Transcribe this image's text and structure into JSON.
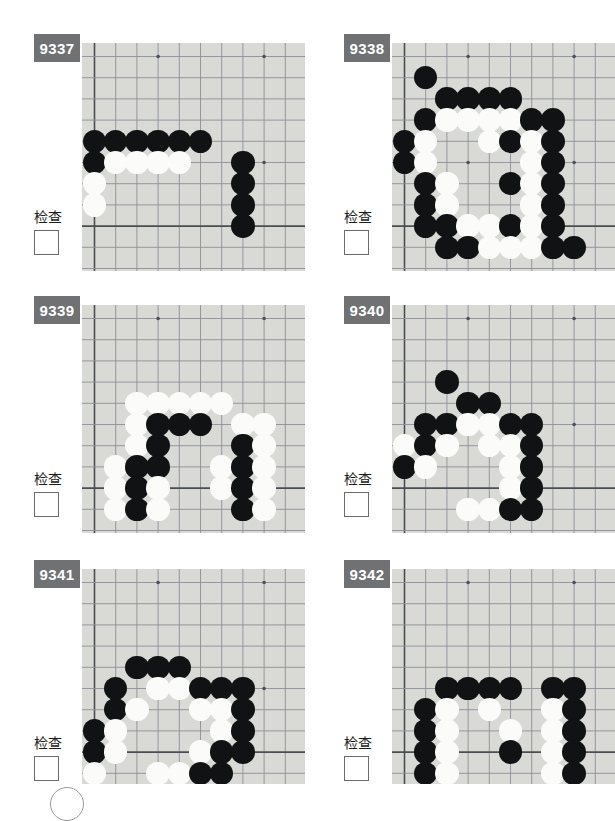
{
  "page": {
    "check_label": "检查",
    "board_color": "#d9dad5",
    "id_box_color": "#6f7173",
    "black_color": "#111214",
    "white_color": "#fbfbf9",
    "grid_cols": 10,
    "grid_rows": 10
  },
  "problems": [
    {
      "id": "9337",
      "check_label": "检查",
      "checked": false,
      "star_points": [
        [
          4,
          1
        ],
        [
          9,
          1
        ],
        [
          4,
          6
        ],
        [
          9,
          6
        ]
      ],
      "edges": {
        "left": 1,
        "bottom": 9
      },
      "stones": [
        {
          "c": 1,
          "r": 5,
          "color": "black"
        },
        {
          "c": 2,
          "r": 5,
          "color": "black"
        },
        {
          "c": 3,
          "r": 5,
          "color": "black"
        },
        {
          "c": 4,
          "r": 5,
          "color": "black"
        },
        {
          "c": 5,
          "r": 5,
          "color": "black"
        },
        {
          "c": 6,
          "r": 5,
          "color": "black"
        },
        {
          "c": 1,
          "r": 6,
          "color": "black"
        },
        {
          "c": 2,
          "r": 6,
          "color": "white"
        },
        {
          "c": 3,
          "r": 6,
          "color": "white"
        },
        {
          "c": 4,
          "r": 6,
          "color": "white"
        },
        {
          "c": 5,
          "r": 6,
          "color": "white"
        },
        {
          "c": 8,
          "r": 6,
          "color": "black"
        },
        {
          "c": 1,
          "r": 7,
          "color": "white"
        },
        {
          "c": 8,
          "r": 7,
          "color": "black"
        },
        {
          "c": 1,
          "r": 8,
          "color": "white"
        },
        {
          "c": 8,
          "r": 8,
          "color": "black"
        },
        {
          "c": 8,
          "r": 9,
          "color": "black"
        }
      ]
    },
    {
      "id": "9338",
      "check_label": "检查",
      "checked": false,
      "star_points": [
        [
          4,
          1
        ],
        [
          9,
          1
        ],
        [
          4,
          6
        ],
        [
          9,
          6
        ]
      ],
      "edges": {
        "left": 1,
        "bottom": 9
      },
      "stones": [
        {
          "c": 2,
          "r": 2,
          "color": "black"
        },
        {
          "c": 3,
          "r": 3,
          "color": "black"
        },
        {
          "c": 4,
          "r": 3,
          "color": "black"
        },
        {
          "c": 5,
          "r": 3,
          "color": "black"
        },
        {
          "c": 6,
          "r": 3,
          "color": "black"
        },
        {
          "c": 2,
          "r": 4,
          "color": "black"
        },
        {
          "c": 3,
          "r": 4,
          "color": "white"
        },
        {
          "c": 4,
          "r": 4,
          "color": "white"
        },
        {
          "c": 5,
          "r": 4,
          "color": "white"
        },
        {
          "c": 6,
          "r": 4,
          "color": "white"
        },
        {
          "c": 7,
          "r": 4,
          "color": "black"
        },
        {
          "c": 8,
          "r": 4,
          "color": "black"
        },
        {
          "c": 1,
          "r": 5,
          "color": "black"
        },
        {
          "c": 2,
          "r": 5,
          "color": "white"
        },
        {
          "c": 5,
          "r": 5,
          "color": "white"
        },
        {
          "c": 6,
          "r": 5,
          "color": "black"
        },
        {
          "c": 7,
          "r": 5,
          "color": "white"
        },
        {
          "c": 8,
          "r": 5,
          "color": "black"
        },
        {
          "c": 1,
          "r": 6,
          "color": "black"
        },
        {
          "c": 2,
          "r": 6,
          "color": "white"
        },
        {
          "c": 7,
          "r": 6,
          "color": "white"
        },
        {
          "c": 8,
          "r": 6,
          "color": "black"
        },
        {
          "c": 2,
          "r": 7,
          "color": "black"
        },
        {
          "c": 3,
          "r": 7,
          "color": "white"
        },
        {
          "c": 6,
          "r": 7,
          "color": "black"
        },
        {
          "c": 7,
          "r": 7,
          "color": "white"
        },
        {
          "c": 8,
          "r": 7,
          "color": "black"
        },
        {
          "c": 2,
          "r": 8,
          "color": "black"
        },
        {
          "c": 3,
          "r": 8,
          "color": "white"
        },
        {
          "c": 7,
          "r": 8,
          "color": "white"
        },
        {
          "c": 8,
          "r": 8,
          "color": "black"
        },
        {
          "c": 2,
          "r": 9,
          "color": "black"
        },
        {
          "c": 3,
          "r": 9,
          "color": "black"
        },
        {
          "c": 4,
          "r": 9,
          "color": "white"
        },
        {
          "c": 5,
          "r": 9,
          "color": "white"
        },
        {
          "c": 6,
          "r": 9,
          "color": "black"
        },
        {
          "c": 7,
          "r": 9,
          "color": "white"
        },
        {
          "c": 8,
          "r": 9,
          "color": "black"
        },
        {
          "c": 3,
          "r": 10,
          "color": "black"
        },
        {
          "c": 4,
          "r": 10,
          "color": "black"
        },
        {
          "c": 5,
          "r": 10,
          "color": "white"
        },
        {
          "c": 6,
          "r": 10,
          "color": "white"
        },
        {
          "c": 7,
          "r": 10,
          "color": "white"
        },
        {
          "c": 8,
          "r": 10,
          "color": "black"
        },
        {
          "c": 9,
          "r": 10,
          "color": "black"
        }
      ]
    },
    {
      "id": "9339",
      "check_label": "检查",
      "checked": false,
      "star_points": [
        [
          4,
          1
        ],
        [
          9,
          1
        ],
        [
          4,
          6
        ],
        [
          9,
          6
        ]
      ],
      "edges": {
        "left": 1,
        "bottom": 9
      },
      "stones": [
        {
          "c": 3,
          "r": 5,
          "color": "white"
        },
        {
          "c": 4,
          "r": 5,
          "color": "white"
        },
        {
          "c": 5,
          "r": 5,
          "color": "white"
        },
        {
          "c": 6,
          "r": 5,
          "color": "white"
        },
        {
          "c": 7,
          "r": 5,
          "color": "white"
        },
        {
          "c": 3,
          "r": 6,
          "color": "white"
        },
        {
          "c": 4,
          "r": 6,
          "color": "black"
        },
        {
          "c": 5,
          "r": 6,
          "color": "black"
        },
        {
          "c": 6,
          "r": 6,
          "color": "black"
        },
        {
          "c": 8,
          "r": 6,
          "color": "white"
        },
        {
          "c": 9,
          "r": 6,
          "color": "white"
        },
        {
          "c": 3,
          "r": 7,
          "color": "white"
        },
        {
          "c": 4,
          "r": 7,
          "color": "black"
        },
        {
          "c": 8,
          "r": 7,
          "color": "black"
        },
        {
          "c": 9,
          "r": 7,
          "color": "white"
        },
        {
          "c": 2,
          "r": 8,
          "color": "white"
        },
        {
          "c": 3,
          "r": 8,
          "color": "black"
        },
        {
          "c": 4,
          "r": 8,
          "color": "black"
        },
        {
          "c": 7,
          "r": 8,
          "color": "white"
        },
        {
          "c": 8,
          "r": 8,
          "color": "black"
        },
        {
          "c": 9,
          "r": 8,
          "color": "white"
        },
        {
          "c": 2,
          "r": 9,
          "color": "white"
        },
        {
          "c": 3,
          "r": 9,
          "color": "black"
        },
        {
          "c": 4,
          "r": 9,
          "color": "white"
        },
        {
          "c": 7,
          "r": 9,
          "color": "white"
        },
        {
          "c": 8,
          "r": 9,
          "color": "black"
        },
        {
          "c": 9,
          "r": 9,
          "color": "white"
        },
        {
          "c": 2,
          "r": 10,
          "color": "white"
        },
        {
          "c": 3,
          "r": 10,
          "color": "black"
        },
        {
          "c": 4,
          "r": 10,
          "color": "white"
        },
        {
          "c": 8,
          "r": 10,
          "color": "black"
        },
        {
          "c": 9,
          "r": 10,
          "color": "white"
        }
      ]
    },
    {
      "id": "9340",
      "check_label": "检查",
      "checked": false,
      "star_points": [
        [
          4,
          1
        ],
        [
          9,
          1
        ],
        [
          4,
          6
        ],
        [
          9,
          6
        ]
      ],
      "edges": {
        "left": 1,
        "bottom": 9
      },
      "stones": [
        {
          "c": 3,
          "r": 4,
          "color": "black"
        },
        {
          "c": 4,
          "r": 5,
          "color": "black"
        },
        {
          "c": 5,
          "r": 5,
          "color": "black"
        },
        {
          "c": 2,
          "r": 6,
          "color": "black"
        },
        {
          "c": 3,
          "r": 6,
          "color": "black"
        },
        {
          "c": 4,
          "r": 6,
          "color": "white"
        },
        {
          "c": 5,
          "r": 6,
          "color": "white"
        },
        {
          "c": 6,
          "r": 6,
          "color": "black"
        },
        {
          "c": 7,
          "r": 6,
          "color": "black"
        },
        {
          "c": 1,
          "r": 7,
          "color": "white"
        },
        {
          "c": 2,
          "r": 7,
          "color": "black"
        },
        {
          "c": 3,
          "r": 7,
          "color": "white"
        },
        {
          "c": 5,
          "r": 7,
          "color": "white"
        },
        {
          "c": 6,
          "r": 7,
          "color": "white"
        },
        {
          "c": 7,
          "r": 7,
          "color": "black"
        },
        {
          "c": 1,
          "r": 8,
          "color": "black"
        },
        {
          "c": 2,
          "r": 8,
          "color": "white"
        },
        {
          "c": 6,
          "r": 8,
          "color": "white"
        },
        {
          "c": 7,
          "r": 8,
          "color": "black"
        },
        {
          "c": 6,
          "r": 9,
          "color": "white"
        },
        {
          "c": 7,
          "r": 9,
          "color": "black"
        },
        {
          "c": 4,
          "r": 10,
          "color": "white"
        },
        {
          "c": 5,
          "r": 10,
          "color": "white"
        },
        {
          "c": 6,
          "r": 10,
          "color": "black"
        },
        {
          "c": 7,
          "r": 10,
          "color": "black"
        }
      ]
    },
    {
      "id": "9341",
      "check_label": "检查",
      "checked": false,
      "star_points": [
        [
          4,
          1
        ],
        [
          9,
          1
        ],
        [
          4,
          6
        ],
        [
          9,
          6
        ]
      ],
      "edges": {
        "left": 1,
        "bottom": 9
      },
      "stones": [
        {
          "c": 3,
          "r": 5,
          "color": "black"
        },
        {
          "c": 4,
          "r": 5,
          "color": "black"
        },
        {
          "c": 5,
          "r": 5,
          "color": "black"
        },
        {
          "c": 2,
          "r": 6,
          "color": "black"
        },
        {
          "c": 4,
          "r": 6,
          "color": "white"
        },
        {
          "c": 5,
          "r": 6,
          "color": "white"
        },
        {
          "c": 6,
          "r": 6,
          "color": "black"
        },
        {
          "c": 7,
          "r": 6,
          "color": "black"
        },
        {
          "c": 8,
          "r": 6,
          "color": "black"
        },
        {
          "c": 2,
          "r": 7,
          "color": "black"
        },
        {
          "c": 3,
          "r": 7,
          "color": "white"
        },
        {
          "c": 6,
          "r": 7,
          "color": "white"
        },
        {
          "c": 7,
          "r": 7,
          "color": "white"
        },
        {
          "c": 8,
          "r": 7,
          "color": "black"
        },
        {
          "c": 1,
          "r": 8,
          "color": "black"
        },
        {
          "c": 2,
          "r": 8,
          "color": "white"
        },
        {
          "c": 7,
          "r": 8,
          "color": "white"
        },
        {
          "c": 8,
          "r": 8,
          "color": "black"
        },
        {
          "c": 1,
          "r": 9,
          "color": "black"
        },
        {
          "c": 2,
          "r": 9,
          "color": "white"
        },
        {
          "c": 6,
          "r": 9,
          "color": "white"
        },
        {
          "c": 7,
          "r": 9,
          "color": "black"
        },
        {
          "c": 8,
          "r": 9,
          "color": "black"
        },
        {
          "c": 1,
          "r": 10,
          "color": "white"
        },
        {
          "c": 4,
          "r": 10,
          "color": "white"
        },
        {
          "c": 5,
          "r": 10,
          "color": "white"
        },
        {
          "c": 6,
          "r": 10,
          "color": "black"
        },
        {
          "c": 7,
          "r": 10,
          "color": "black"
        }
      ]
    },
    {
      "id": "9342",
      "check_label": "检查",
      "checked": false,
      "star_points": [
        [
          4,
          1
        ],
        [
          9,
          1
        ],
        [
          4,
          6
        ],
        [
          9,
          6
        ]
      ],
      "edges": {
        "left": 1,
        "bottom": 9
      },
      "stones": [
        {
          "c": 3,
          "r": 6,
          "color": "black"
        },
        {
          "c": 4,
          "r": 6,
          "color": "black"
        },
        {
          "c": 5,
          "r": 6,
          "color": "black"
        },
        {
          "c": 6,
          "r": 6,
          "color": "black"
        },
        {
          "c": 8,
          "r": 6,
          "color": "black"
        },
        {
          "c": 9,
          "r": 6,
          "color": "black"
        },
        {
          "c": 2,
          "r": 7,
          "color": "black"
        },
        {
          "c": 3,
          "r": 7,
          "color": "white"
        },
        {
          "c": 5,
          "r": 7,
          "color": "white"
        },
        {
          "c": 8,
          "r": 7,
          "color": "white"
        },
        {
          "c": 9,
          "r": 7,
          "color": "black"
        },
        {
          "c": 2,
          "r": 8,
          "color": "black"
        },
        {
          "c": 3,
          "r": 8,
          "color": "white"
        },
        {
          "c": 6,
          "r": 8,
          "color": "white"
        },
        {
          "c": 8,
          "r": 8,
          "color": "white"
        },
        {
          "c": 9,
          "r": 8,
          "color": "black"
        },
        {
          "c": 2,
          "r": 9,
          "color": "black"
        },
        {
          "c": 3,
          "r": 9,
          "color": "white"
        },
        {
          "c": 6,
          "r": 9,
          "color": "black"
        },
        {
          "c": 8,
          "r": 9,
          "color": "white"
        },
        {
          "c": 9,
          "r": 9,
          "color": "black"
        },
        {
          "c": 2,
          "r": 10,
          "color": "black"
        },
        {
          "c": 3,
          "r": 10,
          "color": "white"
        },
        {
          "c": 8,
          "r": 10,
          "color": "white"
        },
        {
          "c": 9,
          "r": 10,
          "color": "black"
        }
      ]
    }
  ]
}
